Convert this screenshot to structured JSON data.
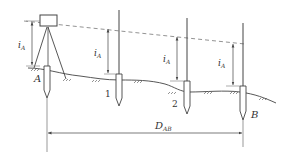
{
  "diagram": {
    "colors": {
      "stroke": "#444444",
      "dashed": "#777777",
      "text": "#333333",
      "background": "#ffffff"
    },
    "instrument_height_label": "i",
    "instrument_height_subscript": "A",
    "points": [
      {
        "id": "A",
        "label": "A"
      },
      {
        "id": "1",
        "label": "1"
      },
      {
        "id": "2",
        "label": "2"
      },
      {
        "id": "B",
        "label": "B"
      }
    ],
    "distance": {
      "label": "D",
      "subscript": "AB"
    }
  }
}
